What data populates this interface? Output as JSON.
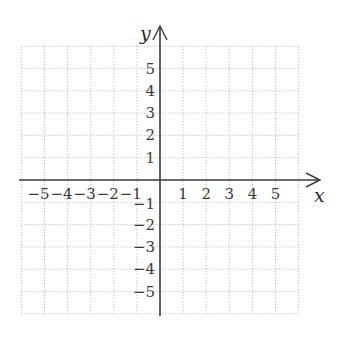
{
  "chart_data": {
    "type": "scatter",
    "title": "",
    "xlabel": "x",
    "ylabel": "y",
    "xlim": [
      -6,
      6
    ],
    "ylim": [
      -6,
      6
    ],
    "grid": true,
    "grid_style": "dotted",
    "x_ticks": [
      -5,
      -4,
      -3,
      -2,
      -1,
      1,
      2,
      3,
      4,
      5
    ],
    "y_ticks": [
      -5,
      -4,
      -3,
      -2,
      -1,
      1,
      2,
      3,
      4,
      5
    ],
    "x_tick_labels": [
      "−5",
      "−4",
      "−3",
      "−2",
      "−1",
      "1",
      "2",
      "3",
      "4",
      "5"
    ],
    "y_tick_labels": [
      "−5",
      "−4",
      "−3",
      "−2",
      "−1",
      "1",
      "2",
      "3",
      "4",
      "5"
    ],
    "series": [],
    "legend": null
  },
  "axes": {
    "x_name": "x",
    "y_name": "y"
  },
  "colors": {
    "axis": "#3a3a3a",
    "grid": "#b0b0b0",
    "text": "#3a3a3a"
  }
}
